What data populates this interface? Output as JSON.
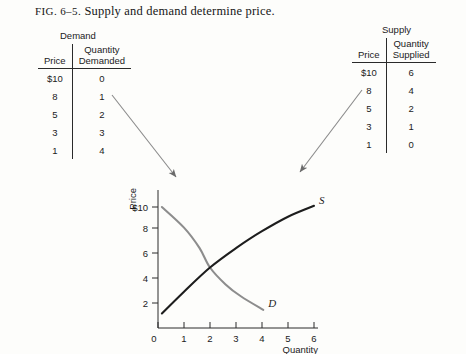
{
  "caption": {
    "fig_label": "FIG. 6–5.",
    "text": "Supply and demand determine price."
  },
  "demand_table": {
    "title": "Demand",
    "headers": [
      "Price",
      "Quantity Demanded"
    ],
    "header_price": "Price",
    "header_qty_line1": "Quantity",
    "header_qty_line2": "Demanded",
    "rows": [
      {
        "price": "$10",
        "qty": "0"
      },
      {
        "price": "8",
        "qty": "1"
      },
      {
        "price": "5",
        "qty": "2"
      },
      {
        "price": "3",
        "qty": "3"
      },
      {
        "price": "1",
        "qty": "4"
      }
    ]
  },
  "supply_table": {
    "title": "Supply",
    "headers": [
      "Price",
      "Quantity Supplied"
    ],
    "header_price": "Price",
    "header_qty_line1": "Quantity",
    "header_qty_line2": "Supplied",
    "rows": [
      {
        "price": "$10",
        "qty": "6"
      },
      {
        "price": "8",
        "qty": "4"
      },
      {
        "price": "5",
        "qty": "2"
      },
      {
        "price": "3",
        "qty": "1"
      },
      {
        "price": "1",
        "qty": "0"
      }
    ]
  },
  "chart_data": {
    "type": "line",
    "title": "",
    "xlabel": "Quantity",
    "ylabel": "Price",
    "xlim": [
      0,
      6.6
    ],
    "ylim": [
      0,
      11
    ],
    "grid": false,
    "legend": "inline-end-labels",
    "x_ticks": [
      "0",
      "1",
      "2",
      "3",
      "4",
      "5",
      "6"
    ],
    "x_tick_values": [
      0,
      1,
      2,
      3,
      4,
      5,
      6
    ],
    "y_ticks": [
      "$10",
      "8",
      "6",
      "4",
      "2"
    ],
    "y_tick_values": [
      10,
      8,
      6,
      4,
      2
    ],
    "series": [
      {
        "name": "S",
        "label": "S",
        "description": "Supply curve, upward sloping",
        "color": "#1d1d1d",
        "points": [
          {
            "x": 0.15,
            "y": 1.2
          },
          {
            "x": 1.0,
            "y": 3.0
          },
          {
            "x": 2.0,
            "y": 5.0
          },
          {
            "x": 3.0,
            "y": 6.6
          },
          {
            "x": 4.0,
            "y": 8.0
          },
          {
            "x": 5.0,
            "y": 9.2
          },
          {
            "x": 6.0,
            "y": 10.1
          }
        ]
      },
      {
        "name": "D",
        "label": "D",
        "description": "Demand curve, downward sloping",
        "color": "#8d8d8d",
        "points": [
          {
            "x": 0.15,
            "y": 10.0
          },
          {
            "x": 1.0,
            "y": 8.3
          },
          {
            "x": 1.6,
            "y": 6.6
          },
          {
            "x": 2.0,
            "y": 5.0
          },
          {
            "x": 2.6,
            "y": 3.6
          },
          {
            "x": 3.2,
            "y": 2.6
          },
          {
            "x": 4.05,
            "y": 1.5
          }
        ]
      }
    ],
    "equilibrium": {
      "x": 2,
      "y": 5
    }
  },
  "annotations": {
    "demand_arrow": "arrow from demand table to demand curve",
    "supply_arrow": "arrow from supply table to supply curve"
  }
}
